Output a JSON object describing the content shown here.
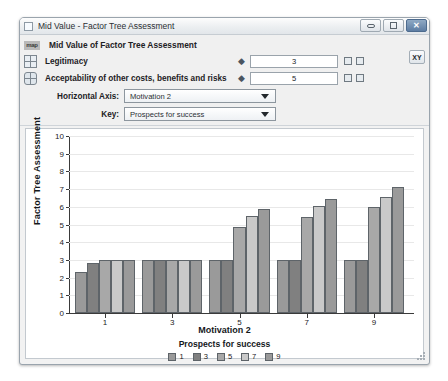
{
  "window": {
    "title": "Mid Value - Factor Tree Assessment",
    "minimize_label": "",
    "maximize_label": "",
    "close_label": "✕"
  },
  "header": {
    "badge": "map",
    "subtitle": "Mid Value of Factor Tree Assessment",
    "xy_button": "XY"
  },
  "parameters": [
    {
      "label": "Legitimacy",
      "value": "3"
    },
    {
      "label": "Acceptability of other costs, benefits  and risks",
      "value": "5"
    }
  ],
  "selectors": [
    {
      "label": "Horizontal Axis:",
      "value": "Motivation 2"
    },
    {
      "label": "Key:",
      "value": "Prospects for success"
    }
  ],
  "chart_data": {
    "type": "bar",
    "title": "",
    "xlabel": "Motivation 2",
    "ylabel": "Factor Tree Assessment",
    "ylim": [
      0,
      10
    ],
    "yticks": [
      0,
      1,
      2,
      3,
      4,
      5,
      6,
      7,
      8,
      9,
      10
    ],
    "grid": true,
    "legend_title": "Prospects for success",
    "legend_position": "bottom",
    "categories": [
      "1",
      "3",
      "5",
      "7",
      "9"
    ],
    "xtick_labels": [
      "1",
      "3",
      "5",
      "7",
      "9"
    ],
    "series": [
      {
        "name": "1",
        "color": "#9a9a9a",
        "values": [
          2.3,
          3.0,
          3.0,
          3.0,
          3.0
        ]
      },
      {
        "name": "3",
        "color": "#808080",
        "values": [
          2.85,
          3.0,
          3.0,
          3.0,
          3.0
        ]
      },
      {
        "name": "5",
        "color": "#a8a8a8",
        "values": [
          3.0,
          3.0,
          4.85,
          5.4,
          6.0
        ]
      },
      {
        "name": "7",
        "color": "#c9c9c9",
        "values": [
          3.0,
          3.0,
          5.5,
          6.05,
          6.55
        ]
      },
      {
        "name": "9",
        "color": "#9a9a9a",
        "values": [
          3.0,
          3.0,
          5.9,
          6.45,
          7.1
        ]
      }
    ]
  }
}
